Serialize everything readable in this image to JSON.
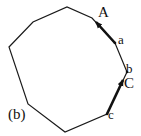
{
  "figure": {
    "label": "(b)",
    "shape": "nonagon",
    "stroke_color": "#1a1a1a",
    "vertices": [
      [
        9,
        47
      ],
      [
        33,
        22
      ],
      [
        67,
        7
      ],
      [
        92,
        18
      ],
      [
        115,
        43
      ],
      [
        127,
        72
      ],
      [
        107,
        114
      ],
      [
        65,
        132
      ],
      [
        28,
        104
      ]
    ],
    "points": {
      "a": "a",
      "b": "b",
      "c": "c"
    },
    "vectors": {
      "A": "A",
      "C": "C"
    }
  }
}
